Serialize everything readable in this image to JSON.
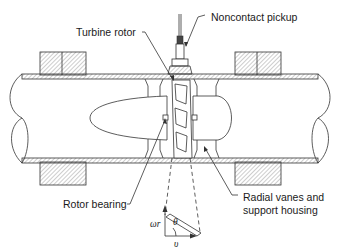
{
  "diagram": {
    "labels": {
      "noncontact_pickup": "Noncontact pickup",
      "turbine_rotor": "Turbine rotor",
      "rotor_bearing": "Rotor bearing",
      "radial_vanes_line1": "Radial vanes and",
      "radial_vanes_line2": "support housing"
    },
    "velocity_triangle": {
      "vertical_symbol": "ωr",
      "horizontal_symbol": "υ",
      "angle_symbol": "θ"
    },
    "colors": {
      "line": "#333333",
      "background": "#ffffff",
      "text": "#1a1a1a"
    }
  }
}
